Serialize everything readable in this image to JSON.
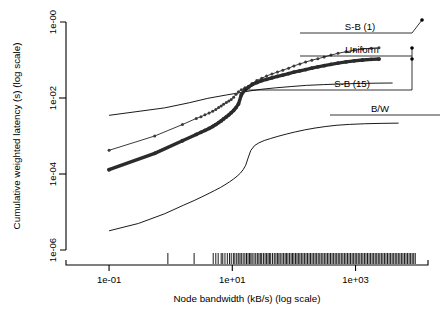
{
  "chart_data": {
    "type": "line",
    "title": "",
    "xlabel": "Node bandwidth (kB/s) (log scale)",
    "ylabel": "Cumulative weighted latency (s) (log scale)",
    "xscale": "log",
    "yscale": "log",
    "xlim": [
      0.02,
      15000
    ],
    "ylim": [
      1e-06,
      1.0
    ],
    "grid": false,
    "legend_position": "right-inline-labels",
    "xticks": [
      {
        "value": 0.1,
        "label": "1e-01"
      },
      {
        "value": 10,
        "label": "1e+01"
      },
      {
        "value": 1000,
        "label": "1e+03"
      }
    ],
    "yticks": [
      {
        "value": 1.0,
        "label": "1e-00"
      },
      {
        "value": 0.01,
        "label": "1e-02"
      },
      {
        "value": 0.0001,
        "label": "1e-04"
      },
      {
        "value": 1e-06,
        "label": "1e-06"
      }
    ],
    "series": [
      {
        "name": "S-B (1)",
        "label": "S-B (1)",
        "style": "thin-with-points",
        "color": "#3a3a3a",
        "x": [
          0.1,
          0.55,
          1.55,
          2.6,
          3.1,
          3.6,
          4.2,
          4.8,
          5.4,
          6.0,
          6.6,
          7.2,
          8.0,
          8.8,
          9.6,
          10.5,
          11.5,
          12.6,
          14.0,
          16.0,
          18.5,
          21.0,
          25.0,
          30.0,
          36.0,
          44.0,
          54.0,
          66.0,
          82.0,
          100.0,
          125.0,
          155.0,
          195.0,
          245.0,
          310.0,
          400.0,
          520.0,
          700.0,
          950.0,
          1300.0,
          1800.0,
          2400.0
        ],
        "y": [
          0.00042,
          0.001,
          0.002,
          0.0029,
          0.0032,
          0.0036,
          0.004,
          0.0045,
          0.005,
          0.0056,
          0.0062,
          0.0068,
          0.0076,
          0.0083,
          0.0091,
          0.0105,
          0.0125,
          0.0145,
          0.0165,
          0.0185,
          0.0205,
          0.024,
          0.029,
          0.033,
          0.038,
          0.043,
          0.048,
          0.054,
          0.061,
          0.07,
          0.079,
          0.088,
          0.099,
          0.108,
          0.12,
          0.135,
          0.15,
          0.165,
          0.18,
          0.195,
          0.205,
          0.21
        ]
      },
      {
        "name": "S-B (15)",
        "label": "S-B (15)",
        "style": "thick-with-points",
        "color": "#2b2b2b",
        "x": [
          0.1,
          0.55,
          1.55,
          2.6,
          3.1,
          3.6,
          4.2,
          4.8,
          5.4,
          6.0,
          6.6,
          7.2,
          8.0,
          8.8,
          9.6,
          10.5,
          11.5,
          12.6,
          14.0,
          16.0,
          18.5,
          21.0,
          25.0,
          30.0,
          36.0,
          44.0,
          54.0,
          66.0,
          82.0,
          100.0,
          125.0,
          155.0,
          195.0,
          245.0,
          310.0,
          400.0,
          520.0,
          700.0,
          950.0,
          1300.0,
          1800.0,
          2400.0
        ],
        "y": [
          0.00013,
          0.00035,
          0.00075,
          0.0011,
          0.00125,
          0.0014,
          0.00158,
          0.00178,
          0.002,
          0.00225,
          0.0025,
          0.0028,
          0.0032,
          0.0036,
          0.0041,
          0.0047,
          0.0056,
          0.007,
          0.012,
          0.0165,
          0.0195,
          0.0225,
          0.0255,
          0.0285,
          0.031,
          0.034,
          0.037,
          0.04,
          0.044,
          0.048,
          0.052,
          0.056,
          0.061,
          0.066,
          0.071,
          0.077,
          0.083,
          0.089,
          0.095,
          0.1,
          0.104,
          0.106
        ]
      },
      {
        "name": "Uniform",
        "label": "Uniform",
        "style": "plain-thin",
        "color": "#000000",
        "x": [
          0.1,
          0.8,
          2.0,
          4.0,
          8.0,
          14.0,
          20.0,
          30.0,
          50.0,
          90.0,
          160.0,
          300.0,
          600.0,
          1200.0,
          2400.0,
          4000.0
        ],
        "y": [
          0.0035,
          0.0055,
          0.0075,
          0.0098,
          0.012,
          0.014,
          0.0155,
          0.017,
          0.0185,
          0.02,
          0.0215,
          0.0225,
          0.0235,
          0.0242,
          0.0246,
          0.0248
        ]
      },
      {
        "name": "B/W",
        "label": "B/W",
        "style": "plain-thin",
        "color": "#000000",
        "x": [
          0.1,
          0.3,
          0.8,
          1.6,
          2.4,
          3.2,
          4.2,
          5.2,
          6.4,
          7.6,
          9.0,
          10.5,
          12.0,
          13.5,
          15.0,
          16.5,
          18.0,
          20.0,
          23.0,
          27.0,
          33.0,
          42.0,
          55.0,
          75.0,
          105.0,
          150.0,
          220.0,
          330.0,
          500.0,
          800.0,
          1400.0,
          2600.0,
          5000.0
        ],
        "y": [
          3.2e-06,
          5e-06,
          9e-06,
          1.5e-05,
          2e-05,
          2.5e-05,
          3.1e-05,
          3.7e-05,
          4.4e-05,
          5.2e-05,
          6.2e-05,
          7.4e-05,
          8.8e-05,
          0.000105,
          0.00013,
          0.00017,
          0.00026,
          0.00042,
          0.00056,
          0.00066,
          0.00076,
          0.00086,
          0.00098,
          0.00112,
          0.00128,
          0.00145,
          0.00162,
          0.00178,
          0.00192,
          0.00202,
          0.0021,
          0.00215,
          0.00218
        ]
      }
    ],
    "annotations": [
      {
        "label": "S-B (1)",
        "text_x": 360,
        "text_y": 30,
        "leader_from_x": 300,
        "leader_to_x": 412,
        "leader_y": 33,
        "marker_x": 420,
        "marker_y": 22
      },
      {
        "label": "Uniform",
        "text_x": 362,
        "text_y": 53,
        "leader_from_x": 300,
        "leader_to_x": 412,
        "leader_y": 56,
        "marker_x": 412,
        "marker_y": 48
      },
      {
        "label": "S-B (15)",
        "text_x": 352,
        "text_y": 87,
        "leader_from_x": 245,
        "leader_to_x": 412,
        "leader_y": 90,
        "marker_x": 412,
        "marker_y": 59
      },
      {
        "label": "B/W",
        "text_x": 380,
        "text_y": 112,
        "leader_from_x": 330,
        "leader_to_x": 440,
        "leader_y": 115,
        "marker_x": null,
        "marker_y": null
      }
    ],
    "rug": {
      "description": "rug plot of node bandwidth observations along x-axis",
      "values": [
        0.9,
        2.4,
        4.9,
        5.4,
        5.9,
        6.6,
        7.0,
        7.6,
        8.3,
        9.0,
        9.6,
        10.4,
        11.0,
        11.8,
        12.5,
        13.3,
        14.0,
        15.0,
        16.0,
        17.0,
        18.0,
        19.0,
        20.0,
        21.0,
        22.5,
        24.0,
        25.5,
        27.0,
        28.5,
        30.0,
        32.0,
        34.0,
        36.0,
        38.0,
        40.0,
        42.0,
        45.0,
        48.0,
        51.0,
        54.0,
        57.0,
        60.0,
        64.0,
        68.0,
        72.0,
        76.0,
        80.0,
        85.0,
        90.0,
        95.0,
        100.0,
        106.0,
        112.0,
        118.0,
        125.0,
        132.0,
        140.0,
        148.0,
        157.0,
        166.0,
        176.0,
        186.0,
        197.0,
        209.0,
        221.0,
        234.0,
        248.0,
        263.0,
        278.0,
        295.0,
        312.0,
        331.0,
        350.0,
        371.0,
        393.0,
        416.0,
        441.0,
        467.0,
        495.0,
        524.0,
        555.0,
        588.0,
        623.0,
        660.0,
        699.0,
        740.0,
        784.0,
        830.0,
        880.0,
        932.0,
        987.0,
        1045.0,
        1107.0,
        1173.0,
        1242.0,
        1316.0,
        1394.0,
        1477.0,
        1564.0,
        1657.0,
        1755.0,
        1859.0,
        1969.0,
        2086.0,
        2209.0,
        2340.0,
        2479.0,
        2626.0,
        2781.0,
        2946.0,
        3120.0,
        3305.0,
        3501.0,
        3708.0,
        3928.0,
        4161.0,
        4408.0,
        4669.0,
        4946.0,
        5239.0,
        5550.0,
        5879.0,
        6227.0,
        6596.0,
        6987.0,
        7401.0,
        7840.0,
        8305.0,
        8798.0,
        9320.0
      ]
    }
  }
}
